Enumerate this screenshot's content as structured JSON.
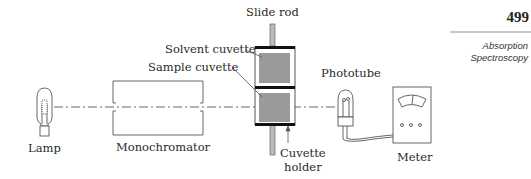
{
  "page": {
    "number": "499",
    "section_lines": [
      "Absorption",
      "Spectroscopy"
    ]
  },
  "diagram": {
    "components": {
      "lamp": "Lamp",
      "monochromator": "Monochromator",
      "slide_rod": "Slide rod",
      "solvent_cuvette": "Solvent cuvette",
      "sample_cuvette": "Sample cuvette",
      "cuvette_holder_line1": "Cuvette",
      "cuvette_holder_line2": "holder",
      "phototube": "Phototube",
      "meter": "Meter"
    },
    "colors": {
      "line": "#555555",
      "cuvette_fill": "#9a9a9a",
      "holder_bar": "#111111"
    }
  }
}
